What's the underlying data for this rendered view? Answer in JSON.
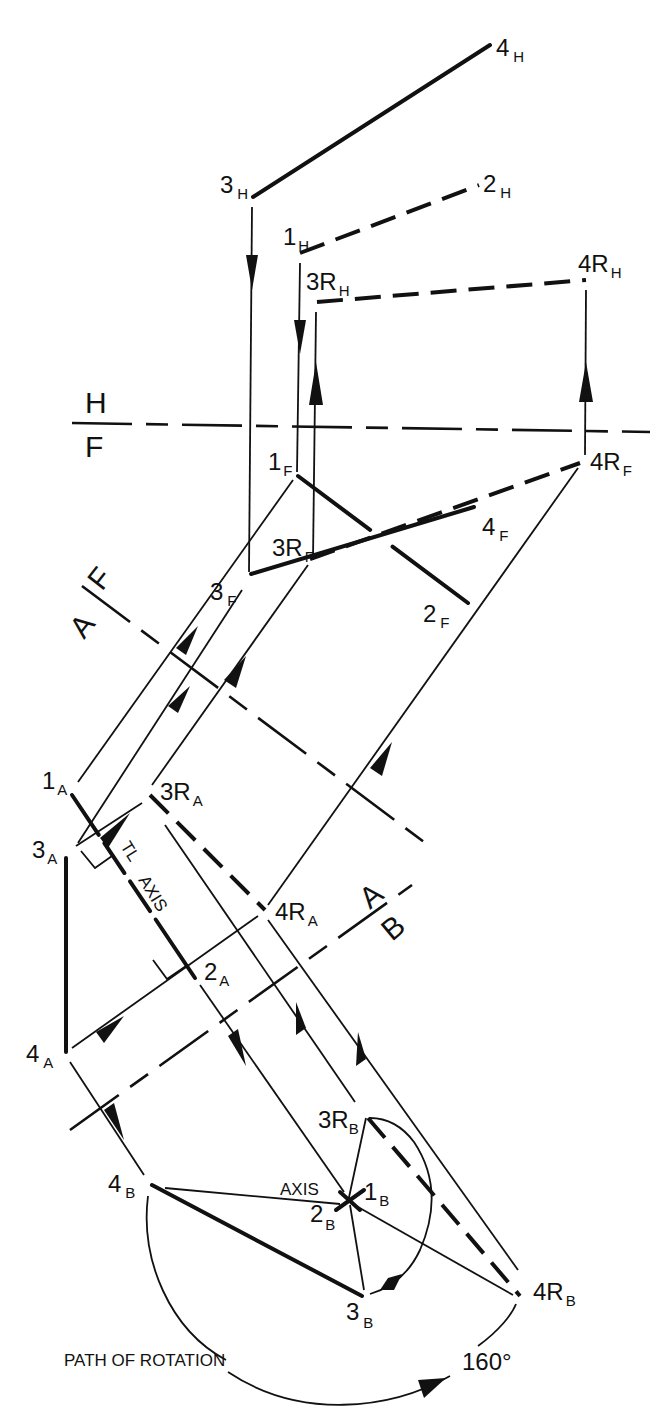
{
  "diagram": {
    "planes": {
      "hf_top": "H",
      "hf_bottom": "F",
      "fa_top": "F",
      "fa_bottom": "A",
      "ab_top": "A",
      "ab_bottom": "B"
    },
    "points": {
      "h": {
        "p4": {
          "main": "4",
          "sub": "H"
        },
        "p3": {
          "main": "3",
          "sub": "H"
        },
        "p2": {
          "main": "2",
          "sub": "H"
        },
        "p1": {
          "main": "1",
          "sub": "H"
        },
        "p3r": {
          "main": "3R",
          "sub": "H"
        },
        "p4r": {
          "main": "4R",
          "sub": "H"
        }
      },
      "f": {
        "p1": {
          "main": "1",
          "sub": "F"
        },
        "p4r": {
          "main": "4R",
          "sub": "F"
        },
        "p3r": {
          "main": "3R",
          "sub": "F"
        },
        "p4": {
          "main": "4",
          "sub": "F"
        },
        "p3": {
          "main": "3",
          "sub": "F"
        },
        "p2": {
          "main": "2",
          "sub": "F"
        }
      },
      "a": {
        "p1": {
          "main": "1",
          "sub": "A"
        },
        "p3r": {
          "main": "3R",
          "sub": "A"
        },
        "p3": {
          "main": "3",
          "sub": "A"
        },
        "p4r": {
          "main": "4R",
          "sub": "A"
        },
        "p2": {
          "main": "2",
          "sub": "A"
        },
        "p4": {
          "main": "4",
          "sub": "A"
        }
      },
      "b": {
        "p3r": {
          "main": "3R",
          "sub": "B"
        },
        "p4": {
          "main": "4",
          "sub": "B"
        },
        "p1": {
          "main": "1",
          "sub": "B"
        },
        "p2": {
          "main": "2",
          "sub": "B"
        },
        "p3": {
          "main": "3",
          "sub": "B"
        },
        "p4r": {
          "main": "4R",
          "sub": "B"
        }
      }
    },
    "annotations": {
      "tl": "TL",
      "axis_a": "AXIS",
      "axis_b": "AXIS",
      "path_of_rotation": "PATH OF ROTATION",
      "angle": "160°"
    }
  }
}
